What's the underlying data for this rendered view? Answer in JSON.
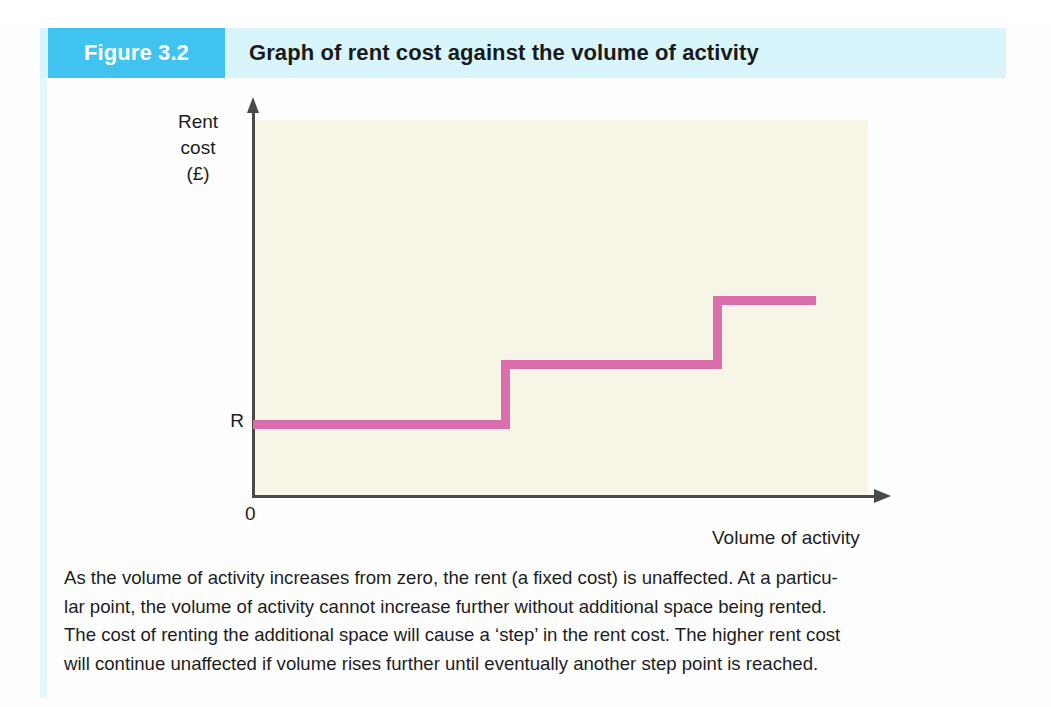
{
  "banner": {
    "figure_number": "Figure 3.2",
    "title": "Graph of rent cost against the volume of activity",
    "tab_color": "#41c3ef",
    "band_color": "#d7f5fa"
  },
  "chart_data": {
    "type": "line",
    "title": "Graph of rent cost against the volume of activity",
    "xlabel": "Volume of activity",
    "ylabel": "Rent cost (£)",
    "ylabel_lines": [
      "Rent",
      "cost",
      "(£)"
    ],
    "origin_label": "0",
    "y_tick_labels": [
      "R"
    ],
    "grid": false,
    "legend": null,
    "line_color": "#db6fae",
    "plot_background": "#f7f6e6",
    "axis_color": "#4a4a48",
    "step_note": "step function: rent is constant over a range of activity, then jumps",
    "x": [
      0,
      0.42,
      0.42,
      0.76,
      0.76,
      1.0
    ],
    "y": [
      1,
      1,
      2,
      2,
      3,
      3
    ],
    "series": [
      {
        "name": "Rent cost",
        "steps": [
          {
            "level": "R",
            "x_start": 0.0,
            "x_end": 0.42,
            "y_value": 1
          },
          {
            "level": "R + one step",
            "x_start": 0.42,
            "x_end": 0.76,
            "y_value": 2
          },
          {
            "level": "R + two steps",
            "x_start": 0.76,
            "x_end": 1.0,
            "y_value": 3
          }
        ]
      }
    ],
    "xlim": [
      0,
      1
    ],
    "ylim": [
      0,
      3.6
    ]
  },
  "caption": {
    "lines": [
      "As the volume of activity increases from zero, the rent (a fixed cost) is unaffected. At a particu-",
      "lar point, the volume of activity cannot increase further without additional space being rented.",
      "The cost of renting the additional space will cause a ‘step’ in the rent cost. The higher rent cost",
      "will continue unaffected if volume rises further until eventually another step point is reached."
    ]
  }
}
